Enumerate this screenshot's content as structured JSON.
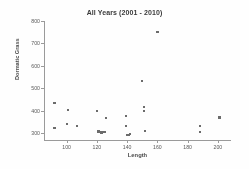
{
  "chart_data": {
    "type": "scatter",
    "title": "All Years (2001 - 2010)",
    "xlabel": "Length",
    "ylabel": "Dormatic Grass",
    "xlim": [
      85,
      208
    ],
    "ylim": [
      270,
      800
    ],
    "xticks": [
      100,
      120,
      140,
      160,
      180,
      200
    ],
    "yticks": [
      300,
      400,
      500,
      600,
      700,
      800
    ],
    "xtick_labels": [
      "100",
      "120",
      "140",
      "160",
      "180",
      "200"
    ],
    "ytick_labels": [
      "300",
      "400",
      "500",
      "600",
      "700",
      "800"
    ],
    "grid": false,
    "legend": null,
    "marker_color": "#6b6b6b",
    "axis_color": "#9a9a9a",
    "points": [
      {
        "x": 92,
        "y": 433
      },
      {
        "x": 92,
        "y": 322
      },
      {
        "x": 101,
        "y": 403
      },
      {
        "x": 100,
        "y": 341
      },
      {
        "x": 107,
        "y": 334
      },
      {
        "x": 120,
        "y": 400
      },
      {
        "x": 121,
        "y": 308
      },
      {
        "x": 123,
        "y": 303
      },
      {
        "x": 125,
        "y": 305
      },
      {
        "x": 126,
        "y": 369
      },
      {
        "x": 139,
        "y": 377
      },
      {
        "x": 139,
        "y": 331
      },
      {
        "x": 140,
        "y": 294
      },
      {
        "x": 141,
        "y": 292
      },
      {
        "x": 142,
        "y": 296
      },
      {
        "x": 150,
        "y": 531
      },
      {
        "x": 151,
        "y": 417
      },
      {
        "x": 151,
        "y": 399
      },
      {
        "x": 152,
        "y": 311
      },
      {
        "x": 160,
        "y": 750
      },
      {
        "x": 188,
        "y": 334
      },
      {
        "x": 188,
        "y": 305
      },
      {
        "x": 201,
        "y": 370
      }
    ]
  }
}
